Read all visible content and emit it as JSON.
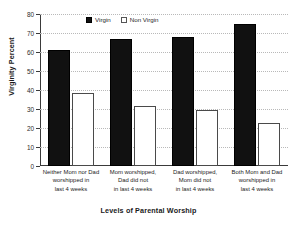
{
  "chart_data": {
    "type": "bar",
    "title": "",
    "xlabel": "Levels of Parental Worship",
    "ylabel": "Virginity Percent",
    "ylim": [
      0,
      80
    ],
    "yticks": [
      0,
      10,
      20,
      30,
      40,
      50,
      60,
      70,
      80
    ],
    "grid": true,
    "legend_position": "top-center",
    "categories": [
      "Neither Mom nor Dad worshipped in last 4 weeks",
      "Mom worshipped, Dad did not in last 4 weeks",
      "Dad worshipped, Mom did not in last 4 weeks",
      "Both Mom and Dad worshipped in last 4 weeks"
    ],
    "category_lines": [
      [
        "Neither Mom nor Dad",
        "worshipped in",
        "last 4 weeks"
      ],
      [
        "Mom worshipped,",
        "Dad did not",
        "in last 4 weeks"
      ],
      [
        "Dad worshipped,",
        "Mom did not",
        "in last 4 weeks"
      ],
      [
        "Both Mom and Dad",
        "worshipped in",
        "last 4 weeks"
      ]
    ],
    "series": [
      {
        "name": "Virgin",
        "color": "#111111",
        "values": [
          61,
          67,
          68,
          74.5
        ]
      },
      {
        "name": "Non Virgin",
        "color": "#ffffff",
        "values": [
          38.5,
          31.5,
          29.5,
          22.5
        ]
      }
    ]
  },
  "legend": {
    "items": [
      {
        "label": "Virgin",
        "style": "filled"
      },
      {
        "label": "Non Virgin",
        "style": "hollow"
      }
    ]
  },
  "axes": {
    "y_title": "Virginity Percent",
    "x_title": "Levels of Parental Worship",
    "y_tick_labels": [
      "0",
      "10",
      "20",
      "30",
      "40",
      "50",
      "60",
      "70",
      "80"
    ]
  }
}
